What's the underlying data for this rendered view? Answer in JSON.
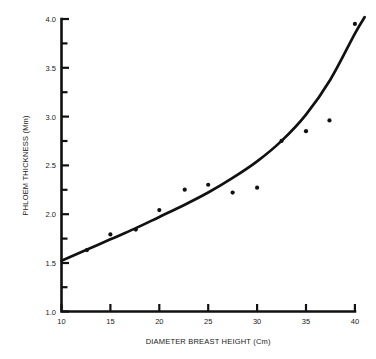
{
  "chart_data": {
    "type": "scatter",
    "title": "",
    "subtitle": "",
    "xlabel": "DIAMETER BREAST HEIGHT (Cm)",
    "ylabel": "PHLOEM THICKNESS (Mm)",
    "xlim": [
      10,
      41
    ],
    "ylim": [
      1.0,
      4.0
    ],
    "grid": false,
    "legend": null,
    "x_ticks": [
      10,
      15,
      20,
      25,
      30,
      35,
      40
    ],
    "x_tick_labels": [
      "10",
      "15",
      "20",
      "25",
      "30",
      "35",
      "40"
    ],
    "y_ticks": [
      1.0,
      1.5,
      2.0,
      2.5,
      3.0,
      3.5,
      4.0
    ],
    "y_tick_labels": [
      "1.0",
      "1.5",
      "2.0",
      "2.5",
      "3.0",
      "3.5",
      "4.0"
    ],
    "y_minor_ticks": [
      1.25,
      1.75,
      2.25,
      2.75,
      3.25,
      3.75
    ],
    "x": [
      12.6,
      15.0,
      17.6,
      20.0,
      22.6,
      25.0,
      27.5,
      30.0,
      32.5,
      35.0,
      37.4,
      40.0
    ],
    "y": [
      1.63,
      1.79,
      1.84,
      2.04,
      2.25,
      2.3,
      2.22,
      2.27,
      2.75,
      2.85,
      2.96,
      3.95
    ],
    "series": [
      {
        "name": "Observed phloem thickness",
        "type": "scatter",
        "marker": "dot",
        "color": "#111111",
        "points": [
          {
            "x": 12.6,
            "y": 1.63
          },
          {
            "x": 15.0,
            "y": 1.79
          },
          {
            "x": 17.6,
            "y": 1.84
          },
          {
            "x": 20.0,
            "y": 2.04
          },
          {
            "x": 22.6,
            "y": 2.25
          },
          {
            "x": 25.0,
            "y": 2.3
          },
          {
            "x": 27.5,
            "y": 2.22
          },
          {
            "x": 30.0,
            "y": 2.27
          },
          {
            "x": 32.5,
            "y": 2.75
          },
          {
            "x": 35.0,
            "y": 2.85
          },
          {
            "x": 37.4,
            "y": 2.96
          },
          {
            "x": 40.0,
            "y": 3.95
          }
        ]
      },
      {
        "name": "Fitted curve",
        "type": "line",
        "color": "#111111",
        "points": [
          {
            "x": 10.0,
            "y": 1.52
          },
          {
            "x": 12.5,
            "y": 1.63
          },
          {
            "x": 15.0,
            "y": 1.74
          },
          {
            "x": 17.5,
            "y": 1.85
          },
          {
            "x": 20.0,
            "y": 1.97
          },
          {
            "x": 22.5,
            "y": 2.09
          },
          {
            "x": 25.0,
            "y": 2.22
          },
          {
            "x": 27.5,
            "y": 2.37
          },
          {
            "x": 30.0,
            "y": 2.54
          },
          {
            "x": 32.5,
            "y": 2.75
          },
          {
            "x": 35.0,
            "y": 3.02
          },
          {
            "x": 37.5,
            "y": 3.38
          },
          {
            "x": 40.0,
            "y": 3.85
          },
          {
            "x": 41.0,
            "y": 4.02
          }
        ]
      }
    ],
    "colors": {
      "axis": "#111111",
      "curve": "#111111",
      "marker": "#111111",
      "background": "#ffffff"
    }
  }
}
